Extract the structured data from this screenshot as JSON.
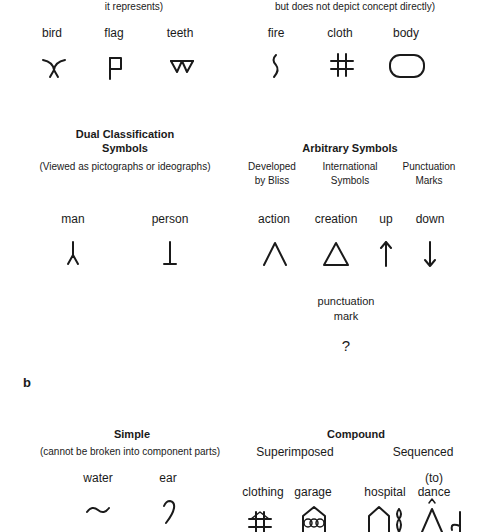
{
  "section_a": {
    "pictographs": {
      "caption_tail": "it represents)",
      "items": [
        {
          "label": "bird",
          "symbol": "bird-symbol"
        },
        {
          "label": "flag",
          "symbol": "flag-symbol"
        },
        {
          "label": "teeth",
          "symbol": "teeth-symbol"
        }
      ]
    },
    "ideographs": {
      "caption_tail": "but does not depict concept directly)",
      "items": [
        {
          "label": "fire",
          "symbol": "fire-symbol"
        },
        {
          "label": "cloth",
          "symbol": "cloth-symbol"
        },
        {
          "label": "body",
          "symbol": "body-symbol"
        }
      ]
    },
    "dual": {
      "title_line1": "Dual Classification",
      "title_line2": "Symbols",
      "subtitle": "(Viewed as pictographs or ideographs)",
      "items": [
        {
          "label": "man",
          "symbol": "man-symbol"
        },
        {
          "label": "person",
          "symbol": "person-symbol"
        }
      ]
    },
    "arbitrary": {
      "title": "Arbitrary Symbols",
      "columns": [
        {
          "line1": "Developed",
          "line2": "by Bliss"
        },
        {
          "line1": "International",
          "line2": "Symbols"
        },
        {
          "line1": "Punctuation",
          "line2": "Marks"
        }
      ],
      "items": [
        {
          "label": "action",
          "symbol": "action-symbol"
        },
        {
          "label": "creation",
          "symbol": "creation-symbol"
        },
        {
          "label": "up",
          "symbol": "up-arrow-symbol"
        },
        {
          "label": "down",
          "symbol": "down-arrow-symbol"
        }
      ],
      "punctuation": {
        "line1": "punctuation",
        "line2": "mark",
        "glyph": "?"
      }
    }
  },
  "section_b": {
    "letter": "b",
    "simple": {
      "title": "Simple",
      "subtitle": "(cannot be broken into component parts)",
      "items": [
        {
          "label": "water",
          "symbol": "water-symbol"
        },
        {
          "label": "ear",
          "symbol": "ear-symbol"
        }
      ]
    },
    "compound": {
      "title": "Compound",
      "superimposed": {
        "label": "Superimposed",
        "items": [
          {
            "label": "clothing",
            "symbol": "clothing-symbol"
          },
          {
            "label": "garage",
            "symbol": "garage-symbol"
          }
        ]
      },
      "sequenced": {
        "label": "Sequenced",
        "items": [
          {
            "label": "hospital",
            "symbol": "hospital-symbol"
          },
          {
            "label_line1": "(to)",
            "label_line2": "dance",
            "symbol": "dance-symbol"
          }
        ]
      }
    }
  }
}
